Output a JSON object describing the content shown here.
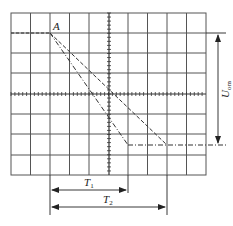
{
  "diagram": {
    "type": "oscilloscope-screen",
    "grid": {
      "cols": 10,
      "rows": 8,
      "left": 11,
      "top": 13,
      "right": 206,
      "bottom": 175
    },
    "colors": {
      "grid": "#555555",
      "trace": "#333333",
      "background": "#ffffff"
    },
    "point_label": "A",
    "traces": [
      {
        "name": "trace-1",
        "style": "dash-dot",
        "from": "A",
        "to_x": 128,
        "to_y": 145
      },
      {
        "name": "trace-2",
        "style": "dashed",
        "from": "A",
        "to_x": 167,
        "to_y": 145
      }
    ],
    "dimensions": {
      "voltage": {
        "label": "U",
        "subscript": "om"
      },
      "t1": {
        "label": "T",
        "subscript": "1"
      },
      "t2": {
        "label": "T",
        "subscript": "2"
      }
    }
  }
}
